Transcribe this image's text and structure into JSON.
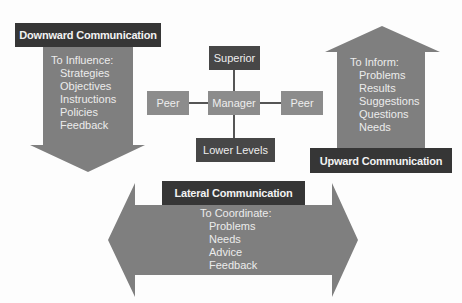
{
  "colors": {
    "arrow": "#7f7f7f",
    "label_dark": "#363636",
    "node_dark": "#474747",
    "node_mid": "#8c8c8c",
    "connector": "#555555",
    "text_light": "#ececec"
  },
  "downward": {
    "label": "Downward Communication",
    "heading": "To Influence:",
    "items": [
      "Strategies",
      "Objectives",
      "Instructions",
      "Policies",
      "Feedback"
    ]
  },
  "upward": {
    "label": "Upward Communication",
    "heading": "To Inform:",
    "items": [
      "Problems",
      "Results",
      "Suggestions",
      "Questions",
      "Needs"
    ]
  },
  "lateral": {
    "label": "Lateral Communication",
    "heading": "To Coordinate:",
    "items": [
      "Problems",
      "Needs",
      "Advice",
      "Feedback"
    ]
  },
  "hierarchy": {
    "superior": "Superior",
    "manager": "Manager",
    "peer_left": "Peer",
    "peer_right": "Peer",
    "lower": "Lower Levels"
  }
}
